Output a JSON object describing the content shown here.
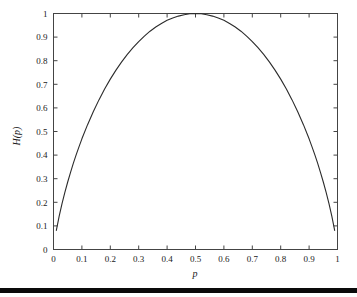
{
  "figure": {
    "background_color": "#ffffff",
    "axis_color": "#444444",
    "curve_color": "#2b2b2b",
    "rule_color": "#0a0a0a",
    "xlabel": "p",
    "ylabel": "H(p)"
  },
  "chart_data": {
    "type": "line",
    "title": "",
    "subtitle": "",
    "xlabel": "p",
    "ylabel": "H(p)",
    "xlim": [
      0,
      1
    ],
    "ylim": [
      0,
      1
    ],
    "grid": false,
    "legend": "none",
    "annotations": [],
    "xticks": [
      0,
      0.1,
      0.2,
      0.3,
      0.4,
      0.5,
      0.6,
      0.7,
      0.8,
      0.9,
      1
    ],
    "xticklabels": [
      "0",
      "0.1",
      "0.2",
      "0.3",
      "0.4",
      "0.5",
      "0.6",
      "0.7",
      "0.8",
      "0.9",
      "1"
    ],
    "yticks": [
      0,
      0.1,
      0.2,
      0.3,
      0.4,
      0.5,
      0.6,
      0.7,
      0.8,
      0.9,
      1
    ],
    "yticklabels": [
      "0",
      "0.1",
      "0.2",
      "0.3",
      "0.4",
      "0.5",
      "0.6",
      "0.7",
      "0.8",
      "0.9",
      "1"
    ],
    "series": [
      {
        "name": "binary entropy",
        "formula": "H(p) = -p*log2(p) - (1-p)*log2(1-p)",
        "x": [
          0.01,
          0.02,
          0.03,
          0.04,
          0.05,
          0.06,
          0.07,
          0.08,
          0.09,
          0.1,
          0.12,
          0.14,
          0.16,
          0.18,
          0.2,
          0.22,
          0.24,
          0.26,
          0.28,
          0.3,
          0.32,
          0.34,
          0.36,
          0.38,
          0.4,
          0.42,
          0.44,
          0.46,
          0.48,
          0.5,
          0.52,
          0.54,
          0.56,
          0.58,
          0.6,
          0.62,
          0.64,
          0.66,
          0.68,
          0.7,
          0.72,
          0.74,
          0.76,
          0.78,
          0.8,
          0.82,
          0.84,
          0.86,
          0.88,
          0.9,
          0.91,
          0.92,
          0.93,
          0.94,
          0.95,
          0.96,
          0.97,
          0.98,
          0.99
        ],
        "y": [
          0.081,
          0.141,
          0.194,
          0.242,
          0.286,
          0.327,
          0.366,
          0.402,
          0.436,
          0.469,
          0.529,
          0.584,
          0.634,
          0.68,
          0.722,
          0.76,
          0.795,
          0.827,
          0.855,
          0.881,
          0.904,
          0.925,
          0.943,
          0.958,
          0.971,
          0.981,
          0.989,
          0.995,
          0.999,
          1.0,
          0.999,
          0.995,
          0.989,
          0.981,
          0.971,
          0.958,
          0.943,
          0.925,
          0.904,
          0.881,
          0.855,
          0.827,
          0.795,
          0.76,
          0.722,
          0.68,
          0.634,
          0.584,
          0.529,
          0.469,
          0.436,
          0.402,
          0.366,
          0.327,
          0.286,
          0.242,
          0.194,
          0.141,
          0.081
        ]
      }
    ]
  }
}
